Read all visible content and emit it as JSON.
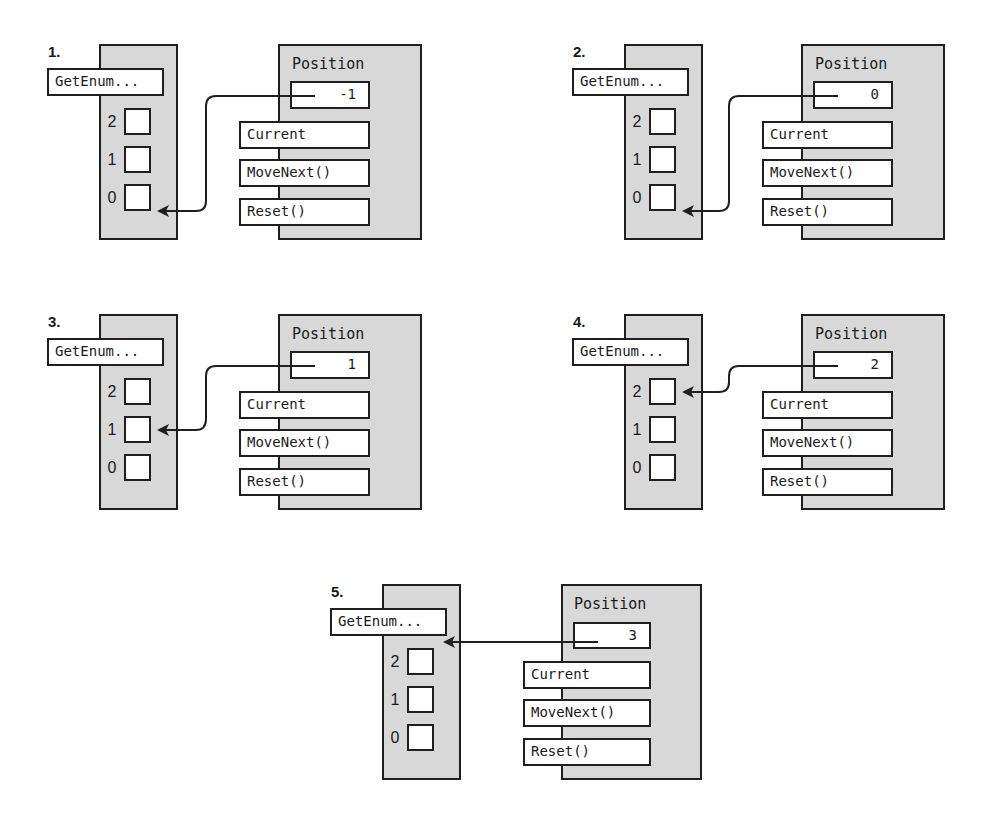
{
  "diagram": {
    "colors": {
      "container_fill": "#d8d8d8",
      "stroke": "#1f1f1f",
      "box_fill": "#ffffff"
    },
    "common": {
      "get_enumerator_label": "GetEnum...",
      "position_label": "Position",
      "members": [
        "Current",
        "MoveNext()",
        "Reset()"
      ],
      "slot_indices": [
        "2",
        "1",
        "0"
      ]
    },
    "panels": [
      {
        "step": "1.",
        "position_value": "-1",
        "arrow_target": "slot-0"
      },
      {
        "step": "2.",
        "position_value": "0",
        "arrow_target": "slot-0"
      },
      {
        "step": "3.",
        "position_value": "1",
        "arrow_target": "slot-1"
      },
      {
        "step": "4.",
        "position_value": "2",
        "arrow_target": "slot-2"
      },
      {
        "step": "5.",
        "position_value": "3",
        "arrow_target": "get-enumerator"
      }
    ]
  }
}
